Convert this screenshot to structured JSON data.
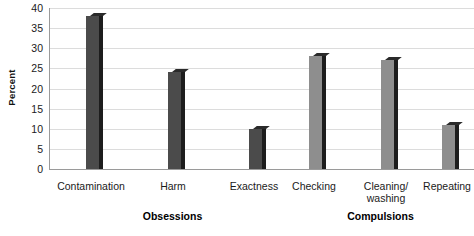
{
  "chart_data": {
    "type": "bar",
    "title": "",
    "xlabel": "",
    "ylabel": "Percent",
    "ylim": [
      0,
      40
    ],
    "yticks": [
      0,
      5,
      10,
      15,
      20,
      25,
      30,
      35,
      40
    ],
    "ytick_labels": [
      "0",
      "5",
      "10",
      "15",
      "20",
      "25",
      "30",
      "35",
      "40"
    ],
    "grid": true,
    "legend": "none",
    "categories": [
      "Contamination",
      "Harm",
      "Exactness",
      "Checking",
      "Cleaning/\nwashing",
      "Repeating"
    ],
    "values": [
      38,
      24,
      10,
      28,
      27,
      11
    ],
    "bar_colors": [
      "#4b4b4b",
      "#4b4b4b",
      "#4b4b4b",
      "#8e8e8e",
      "#8e8e8e",
      "#8e8e8e"
    ],
    "groups": [
      {
        "label": "Obsessions",
        "categories": [
          "Contamination",
          "Harm",
          "Exactness"
        ]
      },
      {
        "label": "Compulsions",
        "categories": [
          "Checking",
          "Cleaning/\nwashing",
          "Repeating"
        ]
      }
    ],
    "colors": {
      "obsessions_bar": "#4b4b4b",
      "compulsions_bar": "#8e8e8e",
      "gridline": "#dcdcdc",
      "axis": "#9a9a9a",
      "text": "#1a1a1a",
      "background": "#ffffff"
    }
  }
}
